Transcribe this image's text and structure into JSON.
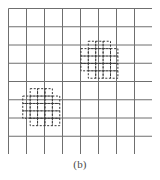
{
  "figure": {
    "caption": "(b)",
    "kind": "grid-with-dashed-cell-clusters",
    "background_color": "#ffffff"
  },
  "grid": {
    "columns": 8,
    "rows": 8,
    "line_color": "#6f6f6f",
    "line_width": 1,
    "border_color": "#6f6f6f",
    "cell_width": 18,
    "cell_height": 18.25,
    "origin_x": 8,
    "origin_y": 8
  },
  "clusters": [
    {
      "id": "cluster-upper-right",
      "label": "upper-right-dashed-cluster",
      "stroke_color": "#3a3a3a",
      "dash_pattern": "2,1.6",
      "stroke_width": 1,
      "micro_cell": 7.4,
      "origin_col": 4.05,
      "origin_row": 1.82,
      "mask": [
        [
          0,
          1,
          1,
          1,
          0
        ],
        [
          1,
          1,
          1,
          1,
          1
        ],
        [
          1,
          1,
          1,
          1,
          1
        ],
        [
          1,
          1,
          1,
          1,
          1
        ],
        [
          0,
          1,
          1,
          1,
          1
        ]
      ]
    },
    {
      "id": "cluster-lower-left",
      "label": "lower-left-dashed-cluster",
      "stroke_color": "#3a3a3a",
      "dash_pattern": "2,1.6",
      "stroke_width": 1,
      "micro_cell": 7.4,
      "origin_col": 0.82,
      "origin_row": 4.42,
      "mask": [
        [
          0,
          1,
          1,
          1,
          0
        ],
        [
          1,
          1,
          1,
          1,
          1
        ],
        [
          1,
          1,
          1,
          1,
          1
        ],
        [
          1,
          1,
          1,
          1,
          1
        ],
        [
          0,
          1,
          1,
          1,
          1
        ]
      ]
    }
  ]
}
